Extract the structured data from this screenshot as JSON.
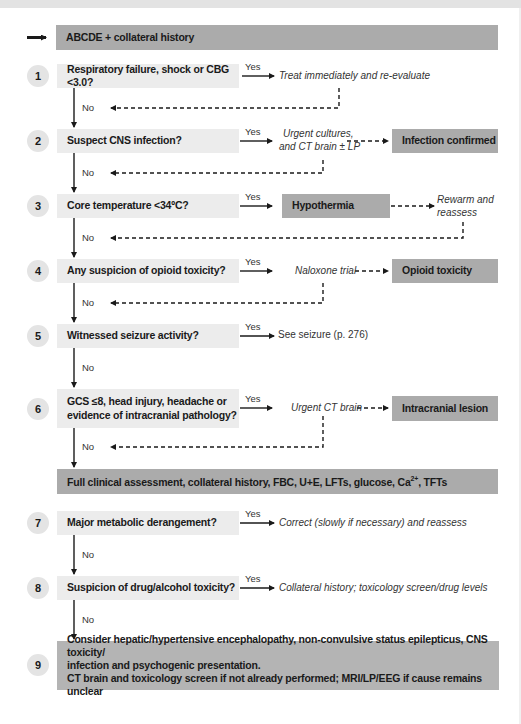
{
  "start": {
    "label": "ABCDE + collateral history"
  },
  "labels": {
    "yes": "Yes",
    "no": "No"
  },
  "steps": [
    {
      "number": "1",
      "question": "Respiratory failure, shock or  CBG <3.0?",
      "yes_action": "Treat immediately and re-evaluate"
    },
    {
      "number": "2",
      "question": "Suspect CNS infection?",
      "yes_action_line1": "Urgent cultures,",
      "yes_action_line2": "and CT brain ± LP",
      "outcome": "Infection confirmed"
    },
    {
      "number": "3",
      "question": "Core temperature <34ºC?",
      "outcome": "Hypothermia",
      "follow_line1": "Rewarm and",
      "follow_line2": "reassess"
    },
    {
      "number": "4",
      "question": "Any suspicion of opioid toxicity?",
      "yes_action": "Naloxone trial",
      "outcome": "Opioid toxicity"
    },
    {
      "number": "5",
      "question": "Witnessed seizure activity?",
      "yes_action": "See seizure (p. 276)"
    },
    {
      "number": "6",
      "question_line1": "GCS ≤8, head injury, headache or",
      "question_line2": "evidence of intracranial pathology?",
      "yes_action": "Urgent CT brain",
      "outcome": "Intracranial lesion"
    },
    {
      "number": "7",
      "question": "Major metabolic derangement?",
      "yes_action": "Correct (slowly if necessary) and reassess"
    },
    {
      "number": "8",
      "question": "Suspicion of drug/alcohol toxicity?",
      "yes_action": "Collateral history; toxicology screen/drug levels"
    },
    {
      "number": "9",
      "line1": "Consider hepatic/hypertensive encephalopathy, non-convulsive status epilepticus, CNS toxicity/",
      "line2": "infection and psychogenic presentation.",
      "line3": "CT brain and toxicology screen if not already performed; MRI/LP/EEG if cause remains unclear"
    }
  ],
  "assessment": {
    "text_before": "Full clinical assessment, collateral history, FBC, U+E, LFTs, glucose, Ca",
    "superscript": "2+",
    "text_after": ", TFTs"
  },
  "colors": {
    "light_box": "#ececec",
    "dark_box": "#ababab",
    "circle": "#e4e4e4",
    "line": "#1a1a1a"
  }
}
